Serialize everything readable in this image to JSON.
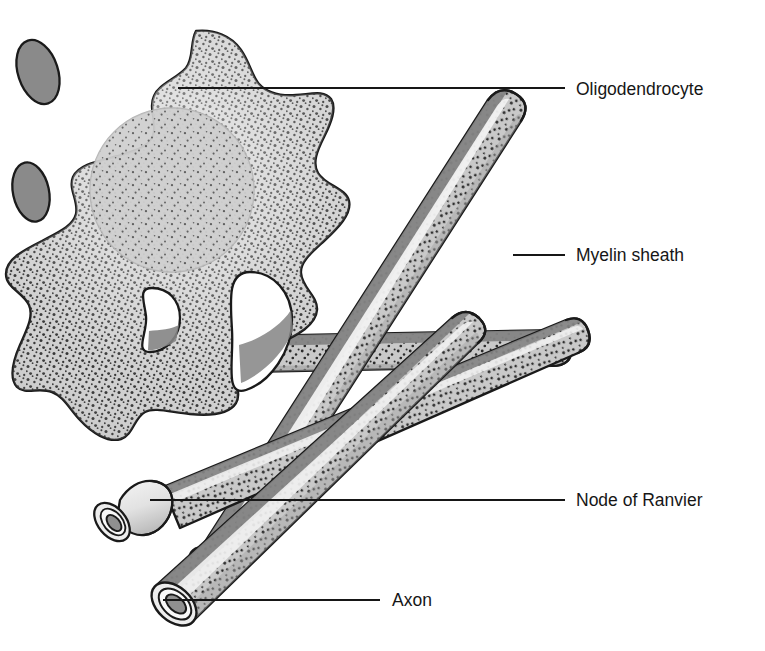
{
  "figure": {
    "background_color": "#ffffff",
    "width": 765,
    "height": 651
  },
  "palette": {
    "ink": "#1a1a1a",
    "label_text": "#161616",
    "cell_body_fill": "#cdcdcd",
    "cell_nucleus_fill": "#c3c3c3",
    "myelin_light_fill": "#c9c9c9",
    "myelin_dark_band": "#848484",
    "tube_highlight": "#efefef",
    "process_end_fill": "#8a8a8a",
    "node_fill": "#e4e4e4",
    "axon_core_fill": "#8f8f8f",
    "stipple_dot": "#2b2b2b"
  },
  "labels": [
    {
      "id": "oligodendrocyte",
      "text": "Oligodendrocyte",
      "text_x": 576,
      "text_y": 90,
      "leader": {
        "x1": 178,
        "y1": 88,
        "x2": 565,
        "y2": 88
      },
      "target": "cell-body"
    },
    {
      "id": "myelin-sheath",
      "text": "Myelin sheath",
      "text_x": 576,
      "text_y": 256,
      "leader": {
        "x1": 513,
        "y1": 255,
        "x2": 565,
        "y2": 255
      },
      "target": "myelin-tube-upper"
    },
    {
      "id": "node-of-ranvier",
      "text": "Node of Ranvier",
      "text_x": 576,
      "text_y": 501,
      "leader": {
        "x1": 150,
        "y1": 500,
        "x2": 565,
        "y2": 500
      },
      "target": "node-segment"
    },
    {
      "id": "axon",
      "text": "Axon",
      "text_x": 392,
      "text_y": 601,
      "leader": {
        "x1": 163,
        "y1": 600,
        "x2": 380,
        "y2": 600
      },
      "target": "axon-core"
    }
  ],
  "structures": [
    {
      "id": "cell-body",
      "name": "Oligodendrocyte cell body",
      "description": "Lobed stippled gray soma with central nucleus"
    },
    {
      "id": "nucleus",
      "name": "Nucleus",
      "description": "Lighter circular region inside the soma"
    },
    {
      "id": "process-end-upper-left",
      "name": "Process end (upper left)",
      "description": "Dark gray elliptical cut end"
    },
    {
      "id": "process-end-lower-left",
      "name": "Process end (lower left)",
      "description": "Dark gray elliptical cut end"
    },
    {
      "id": "myelin-tube-upper",
      "name": "Myelinated axon (upper right)",
      "description": "Diagonal tube running lower-left to upper-right"
    },
    {
      "id": "myelin-tube-lower",
      "name": "Myelinated axon (lower)",
      "description": "Diagonal tube ending in a cut face showing the axon"
    },
    {
      "id": "myelin-tube-horizontal",
      "name": "Myelinated axon (horizontal)",
      "description": "Horizontal tube passing behind the soma"
    },
    {
      "id": "node-segment",
      "name": "Node of Ranvier",
      "description": "Pale unmyelinated constriction between myelin segments"
    },
    {
      "id": "axon-core",
      "name": "Axon",
      "description": "Dark inner core visible at the cut tube ends"
    }
  ]
}
